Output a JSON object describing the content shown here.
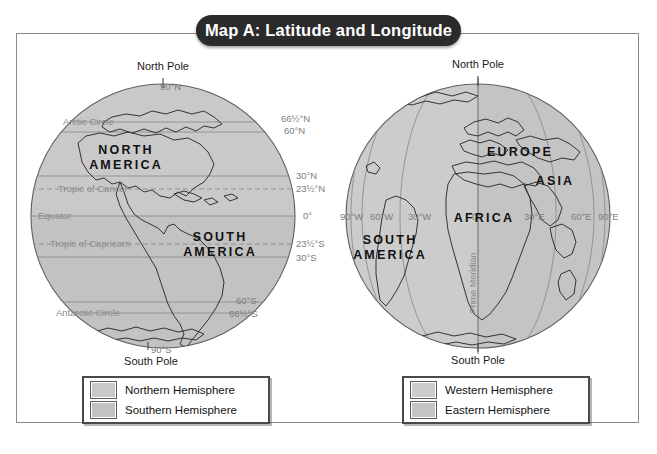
{
  "title": "Map A: Latitude and Longitude",
  "colors": {
    "northern_hemisphere": "#c9c9c9",
    "southern_hemisphere": "#c2c2c2",
    "western_hemisphere": "#cccccc",
    "eastern_hemisphere": "#c4c4c4",
    "coastline": "#333333",
    "gridline": "#8d8d8d",
    "frame": "#8a8a8a",
    "pill_background": "#2b2b2b",
    "pill_text": "#ffffff"
  },
  "globe_left": {
    "name": "latitude-globe",
    "pole_labels": {
      "north": "North Pole",
      "south": "South Pole"
    },
    "continents": [
      {
        "name": "north-america",
        "label": "NORTH\nAMERICA"
      },
      {
        "name": "south-america",
        "label": "SOUTH\nAMERICA"
      }
    ],
    "latitudes": [
      {
        "value": "90°N",
        "named_line": "",
        "style": "tick"
      },
      {
        "value": "66½°N",
        "named_line": "Arctic Circle",
        "style": "solid"
      },
      {
        "value": "60°N",
        "named_line": "",
        "style": "solid"
      },
      {
        "value": "30°N",
        "named_line": "",
        "style": "solid"
      },
      {
        "value": "23½°N",
        "named_line": "Tropic of Cancer",
        "style": "dashed"
      },
      {
        "value": "0°",
        "named_line": "Equator",
        "style": "solid"
      },
      {
        "value": "23½°S",
        "named_line": "Tropic of Capricorn",
        "style": "dashed"
      },
      {
        "value": "30°S",
        "named_line": "",
        "style": "solid"
      },
      {
        "value": "60°S",
        "named_line": "",
        "style": "solid"
      },
      {
        "value": "66½°S",
        "named_line": "Antarctic Circle",
        "style": "solid"
      },
      {
        "value": "90°S",
        "named_line": "",
        "style": "tick"
      }
    ]
  },
  "globe_right": {
    "name": "longitude-globe",
    "pole_labels": {
      "north": "North Pole",
      "south": "South Pole"
    },
    "continents": [
      {
        "name": "europe",
        "label": "EUROPE"
      },
      {
        "name": "asia",
        "label": "ASIA"
      },
      {
        "name": "africa",
        "label": "AFRICA"
      },
      {
        "name": "south-america",
        "label": "SOUTH\nAMERICA"
      }
    ],
    "prime_meridian_label": "Prime Meridian",
    "longitudes": [
      {
        "value": "90°W"
      },
      {
        "value": "60°W"
      },
      {
        "value": "30°W"
      },
      {
        "value": "0°"
      },
      {
        "value": "30°E"
      },
      {
        "value": "60°E"
      },
      {
        "value": "90°E"
      }
    ]
  },
  "legend_left": {
    "name": "hemisphere-legend-latitude",
    "items": [
      {
        "label": "Northern Hemisphere",
        "color": "#c9c9c9"
      },
      {
        "label": "Southern Hemisphere",
        "color": "#c2c2c2"
      }
    ]
  },
  "legend_right": {
    "name": "hemisphere-legend-longitude",
    "items": [
      {
        "label": "Western Hemisphere",
        "color": "#cccccc"
      },
      {
        "label": "Eastern Hemisphere",
        "color": "#c4c4c4"
      }
    ]
  }
}
